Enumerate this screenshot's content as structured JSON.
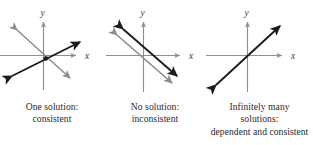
{
  "figure": {
    "background_color": "#ffffff",
    "width": 313,
    "height": 145,
    "axis_color": "#8f8f8f",
    "line_dark_color": "#1c1c1c",
    "line_gray_color": "#8c8c8c",
    "caption_color": "#2b2b2b"
  },
  "panels": [
    {
      "id": "one-solution",
      "axis_x_label": "x",
      "axis_y_label": "y",
      "caption_lines": [
        "One solution:",
        "consistent"
      ],
      "description": "Two intersecting lines with a marked intersection point",
      "lines": [
        {
          "name": "line-gray-descending",
          "color": "#8c8c8c",
          "style": "solid"
        },
        {
          "name": "line-dark-ascending",
          "color": "#1c1c1c",
          "style": "solid"
        }
      ],
      "intersection_point": {
        "marked": "true"
      }
    },
    {
      "id": "no-solution",
      "axis_x_label": "x",
      "axis_y_label": "y",
      "caption_lines": [
        "No solution:",
        "inconsistent"
      ],
      "description": "Two parallel non-intersecting lines",
      "lines": [
        {
          "name": "line-dark-parallel",
          "color": "#1c1c1c",
          "style": "solid"
        },
        {
          "name": "line-gray-parallel",
          "color": "#8c8c8c",
          "style": "solid"
        }
      ],
      "intersection_point": {
        "marked": "false"
      }
    },
    {
      "id": "infinitely-many-solutions",
      "axis_x_label": "x",
      "axis_y_label": "y",
      "caption_lines": [
        "Infinitely many",
        "solutions:",
        "dependent and consistent"
      ],
      "description": "Two coincident overlapping lines",
      "lines": [
        {
          "name": "line-dark-coincident",
          "color": "#1c1c1c",
          "style": "solid"
        }
      ],
      "intersection_point": {
        "marked": "false"
      }
    }
  ]
}
